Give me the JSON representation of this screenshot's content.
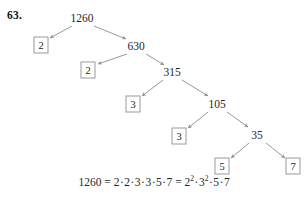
{
  "problem": {
    "number_label": "63.",
    "subject": "prime-factorization-factor-tree"
  },
  "colors": {
    "text": "#262626",
    "arrow": "#8c8c8c",
    "box_border": "#9a9a9a",
    "background": "#ffffff"
  },
  "tree": {
    "root_value": "1260",
    "internal_nodes": [
      {
        "id": "n1260",
        "label": "1260",
        "x": 82,
        "y": 18
      },
      {
        "id": "n630",
        "label": "630",
        "x": 136,
        "y": 46
      },
      {
        "id": "n315",
        "label": "315",
        "x": 172,
        "y": 72
      },
      {
        "id": "n105",
        "label": "105",
        "x": 217,
        "y": 104
      },
      {
        "id": "n35",
        "label": "35",
        "x": 257,
        "y": 135
      }
    ],
    "leaf_nodes": [
      {
        "id": "leaf2a",
        "label": "2",
        "x": 41,
        "y": 45
      },
      {
        "id": "leaf2b",
        "label": "2",
        "x": 88,
        "y": 70
      },
      {
        "id": "leaf3a",
        "label": "3",
        "x": 133,
        "y": 104
      },
      {
        "id": "leaf3b",
        "label": "3",
        "x": 179,
        "y": 136
      },
      {
        "id": "leaf5",
        "label": "5",
        "x": 222,
        "y": 166
      },
      {
        "id": "leaf7",
        "label": "7",
        "x": 293,
        "y": 166
      }
    ],
    "edges": [
      {
        "from": "n1260",
        "to": "leaf2a",
        "x1": 72,
        "y1": 26,
        "x2": 50,
        "y2": 38
      },
      {
        "from": "n1260",
        "to": "n630",
        "x1": 94,
        "y1": 26,
        "x2": 126,
        "y2": 39
      },
      {
        "from": "n630",
        "to": "leaf2b",
        "x1": 127,
        "y1": 54,
        "x2": 98,
        "y2": 64
      },
      {
        "from": "n630",
        "to": "n315",
        "x1": 146,
        "y1": 54,
        "x2": 164,
        "y2": 65
      },
      {
        "from": "n315",
        "to": "leaf3a",
        "x1": 163,
        "y1": 80,
        "x2": 142,
        "y2": 96
      },
      {
        "from": "n315",
        "to": "n105",
        "x1": 182,
        "y1": 80,
        "x2": 208,
        "y2": 96
      },
      {
        "from": "n105",
        "to": "leaf3b",
        "x1": 208,
        "y1": 112,
        "x2": 188,
        "y2": 128
      },
      {
        "from": "n105",
        "to": "n35",
        "x1": 227,
        "y1": 112,
        "x2": 248,
        "y2": 127
      },
      {
        "from": "n35",
        "to": "leaf5",
        "x1": 249,
        "y1": 143,
        "x2": 231,
        "y2": 158
      },
      {
        "from": "n35",
        "to": "leaf7",
        "x1": 266,
        "y1": 143,
        "x2": 285,
        "y2": 158
      }
    ]
  },
  "equation": {
    "lhs": "1260",
    "equals": "=",
    "expanded_factors": [
      "2",
      "2",
      "3",
      "3",
      "5",
      "7"
    ],
    "equals2": "=",
    "powers": [
      {
        "base": "2",
        "exponent": "2"
      },
      {
        "base": "3",
        "exponent": "2"
      },
      {
        "base": "5",
        "exponent": ""
      },
      {
        "base": "7",
        "exponent": ""
      }
    ],
    "multiplication_symbol": "·",
    "full_text": "1260 = 2·2·3·3·5·7 = 2²·3²·5·7",
    "x": 154,
    "y": 182
  }
}
